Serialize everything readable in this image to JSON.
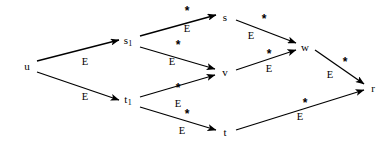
{
  "figure": {
    "kind": "directed-graph-diagram",
    "background_color": "#ffffff",
    "ink_color": "#000000",
    "width": 392,
    "height": 151
  },
  "nodes": [
    {
      "id": "u",
      "label": "u",
      "sub": "",
      "x": 27,
      "y": 66
    },
    {
      "id": "s1",
      "label": "s",
      "sub": "1",
      "x": 128,
      "y": 42
    },
    {
      "id": "t1",
      "label": "t",
      "sub": "1",
      "x": 128,
      "y": 101
    },
    {
      "id": "s",
      "label": "s",
      "sub": "",
      "x": 225,
      "y": 17
    },
    {
      "id": "v",
      "label": "v",
      "sub": "",
      "x": 225,
      "y": 72
    },
    {
      "id": "t",
      "label": "t",
      "sub": "",
      "x": 225,
      "y": 132
    },
    {
      "id": "w",
      "label": "w",
      "sub": "",
      "x": 305,
      "y": 47
    },
    {
      "id": "r",
      "label": "r",
      "sub": "",
      "x": 373,
      "y": 88
    }
  ],
  "edges": [
    {
      "id": "u-s1",
      "from": "u",
      "to": "s1",
      "x1": 37,
      "y1": 61,
      "x2": 119,
      "y2": 40,
      "label_star": "",
      "star_x": 0,
      "star_y": 0,
      "label_e": "E",
      "e_x": 85,
      "e_y": 62
    },
    {
      "id": "u-t1",
      "from": "u",
      "to": "t1",
      "x1": 37,
      "y1": 72,
      "x2": 119,
      "y2": 100,
      "label_star": "",
      "star_x": 0,
      "star_y": 0,
      "label_e": "E",
      "e_x": 85,
      "e_y": 97
    },
    {
      "id": "s1-s",
      "from": "s1",
      "to": "s",
      "x1": 140,
      "y1": 36,
      "x2": 216,
      "y2": 15,
      "label_star": "*",
      "star_x": 187,
      "star_y": 11,
      "label_e": "E",
      "e_x": 187,
      "e_y": 29
    },
    {
      "id": "s1-v",
      "from": "s1",
      "to": "v",
      "x1": 140,
      "y1": 47,
      "x2": 215,
      "y2": 69,
      "label_star": "*",
      "star_x": 178,
      "star_y": 45,
      "label_e": "E",
      "e_x": 172,
      "e_y": 62
    },
    {
      "id": "t1-v",
      "from": "t1",
      "to": "v",
      "x1": 140,
      "y1": 97,
      "x2": 215,
      "y2": 75,
      "label_star": "*",
      "star_x": 178,
      "star_y": 88,
      "label_e": "E",
      "e_x": 178,
      "e_y": 104
    },
    {
      "id": "t1-t",
      "from": "t1",
      "to": "t",
      "x1": 140,
      "y1": 107,
      "x2": 216,
      "y2": 130,
      "label_star": "*",
      "star_x": 187,
      "star_y": 114,
      "label_e": "E",
      "e_x": 182,
      "e_y": 131
    },
    {
      "id": "s-w",
      "from": "s",
      "to": "w",
      "x1": 236,
      "y1": 20,
      "x2": 296,
      "y2": 43,
      "label_star": "*",
      "star_x": 264,
      "star_y": 19,
      "label_e": "E",
      "e_x": 251,
      "e_y": 36
    },
    {
      "id": "v-w",
      "from": "v",
      "to": "w",
      "x1": 236,
      "y1": 70,
      "x2": 296,
      "y2": 50,
      "label_star": "*",
      "star_x": 269,
      "star_y": 54,
      "label_e": "E",
      "e_x": 269,
      "e_y": 69
    },
    {
      "id": "w-r",
      "from": "w",
      "to": "r",
      "x1": 315,
      "y1": 50,
      "x2": 364,
      "y2": 84,
      "label_star": "*",
      "star_x": 345,
      "star_y": 62,
      "label_e": "E",
      "e_x": 330,
      "e_y": 75
    },
    {
      "id": "t-r",
      "from": "t",
      "to": "r",
      "x1": 236,
      "y1": 130,
      "x2": 364,
      "y2": 90,
      "label_star": "*",
      "star_x": 305,
      "star_y": 103,
      "label_e": "E",
      "e_x": 300,
      "e_y": 117
    }
  ]
}
